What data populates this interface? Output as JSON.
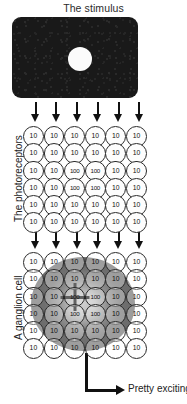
{
  "figure": {
    "title": "The stimulus",
    "caption": "Pretty exciting!",
    "labels": {
      "photoreceptors": "The photoreceptors",
      "ganglion": "A ganglion cell"
    },
    "colors": {
      "stimulus_fill": "#191919",
      "stimulus_spot": "#fbfbfb",
      "ink": "#111111",
      "receptive_field_surround": "#6f6f6f",
      "receptive_field_center": "#cfcfcf"
    },
    "arrow_counts": {
      "stimulus_to_photoreceptors": 6,
      "photoreceptors_to_ganglion": 6
    }
  },
  "chart_data": {
    "type": "heatmap",
    "title": "The stimulus",
    "xlabel": "",
    "ylabel": "",
    "grid_rows": 6,
    "grid_cols": 6,
    "layers": [
      {
        "name": "The photoreceptors",
        "values": [
          [
            10,
            10,
            10,
            10,
            10,
            10
          ],
          [
            10,
            10,
            10,
            10,
            10,
            10
          ],
          [
            10,
            10,
            100,
            100,
            10,
            10
          ],
          [
            10,
            10,
            100,
            100,
            10,
            10
          ],
          [
            10,
            10,
            10,
            10,
            10,
            10
          ],
          [
            10,
            10,
            10,
            10,
            10,
            10
          ]
        ]
      },
      {
        "name": "A ganglion cell",
        "values": [
          [
            10,
            10,
            10,
            10,
            10,
            10
          ],
          [
            10,
            10,
            10,
            10,
            10,
            10
          ],
          [
            10,
            10,
            100,
            100,
            10,
            10
          ],
          [
            10,
            10,
            100,
            100,
            10,
            10
          ],
          [
            10,
            10,
            10,
            10,
            10,
            10
          ],
          [
            10,
            10,
            10,
            10,
            10,
            10
          ]
        ],
        "receptive_field": {
          "shape": "circular center-surround",
          "center_rows": [
            2,
            3
          ],
          "center_cols": [
            2,
            3
          ],
          "annotation": "Pretty exciting!"
        }
      }
    ]
  }
}
